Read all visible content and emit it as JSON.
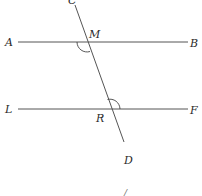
{
  "diagram": {
    "type": "parallel-lines-transversal",
    "labels": {
      "C": "C",
      "A": "A",
      "M": "M",
      "B": "B",
      "L": "L",
      "R": "R",
      "F": "F",
      "D": "D",
      "stray_mark": "/"
    },
    "lines": [
      {
        "name": "AB",
        "from": "A",
        "to": "B"
      },
      {
        "name": "LF",
        "from": "L",
        "to": "F"
      },
      {
        "name": "CD",
        "from": "C",
        "to": "D"
      }
    ],
    "intersections": [
      {
        "point": "M",
        "lines": [
          "AB",
          "CD"
        ],
        "marked_angle": "AMD"
      },
      {
        "point": "R",
        "lines": [
          "LF",
          "CD"
        ],
        "marked_angle": "CRF"
      }
    ],
    "colors": {
      "line": "#555555",
      "label": "#2a2a2a"
    }
  }
}
